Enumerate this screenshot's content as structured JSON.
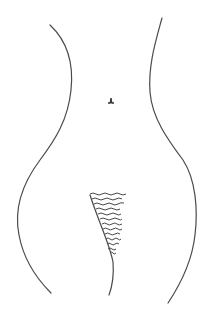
{
  "figure": {
    "type": "line-drawing",
    "stroke_color": "#4a4a4a",
    "background": "#ffffff",
    "elements": [
      "left-body-contour",
      "right-body-contour",
      "navel-mark",
      "inner-contour",
      "hatching"
    ]
  }
}
